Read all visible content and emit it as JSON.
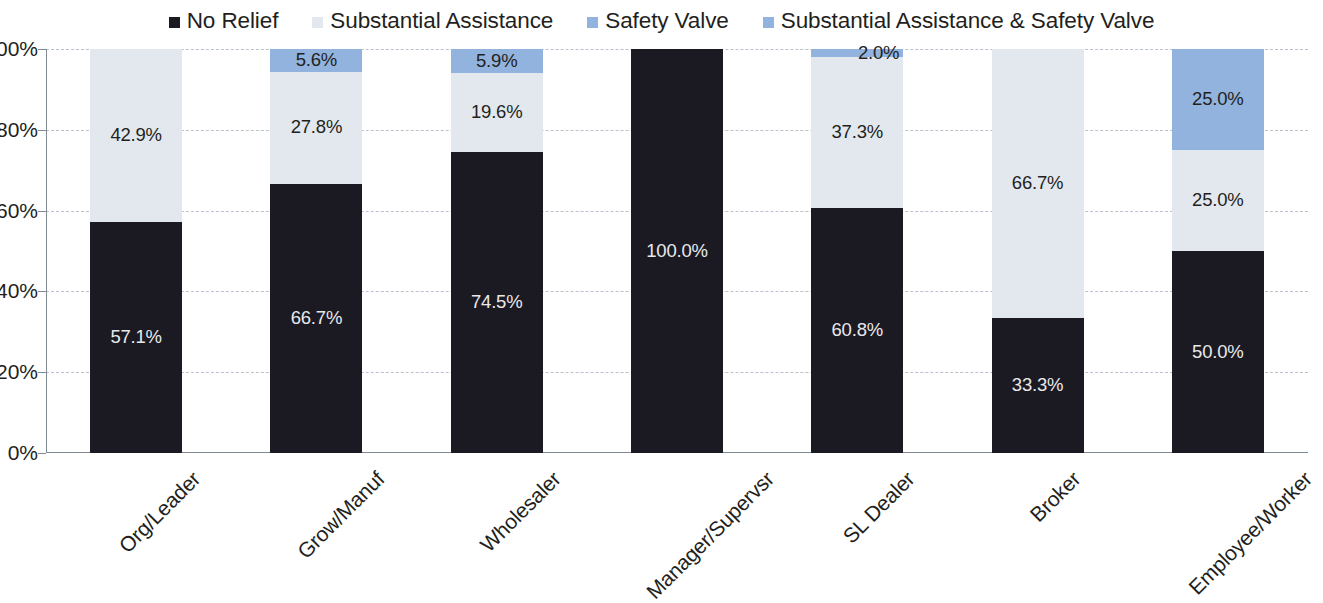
{
  "legend": {
    "items": [
      {
        "label": "No Relief",
        "color": "#1b1a22",
        "key": "no_relief"
      },
      {
        "label": "Substantial Assistance",
        "color": "#e2e8ee",
        "key": "substantial_assistance"
      },
      {
        "label": "Safety Valve",
        "color": "#91b3dd",
        "key": "safety_valve"
      },
      {
        "label": "Substantial Assistance & Safety Valve",
        "color": "#91b3dd",
        "key": "substantial_and_safety"
      }
    ]
  },
  "axis": {
    "y_ticks": [
      "0%",
      "20%",
      "40%",
      "60%",
      "80%",
      "100%"
    ],
    "y_tick_values": [
      0,
      20,
      40,
      60,
      80,
      100
    ]
  },
  "chart_data": {
    "type": "bar",
    "subtype": "100% stacked column",
    "title": "",
    "xlabel": "",
    "ylabel": "",
    "ylim": [
      0,
      100
    ],
    "grid": true,
    "legend_position": "top",
    "categories": [
      "Org/Leader",
      "Grow/Manuf",
      "Wholesaler",
      "Manager/Supervsr",
      "SL Dealer",
      "Broker",
      "Employee/Worker"
    ],
    "series": [
      {
        "name": "No Relief",
        "color": "#1b1a22",
        "values": [
          57.1,
          66.7,
          74.5,
          100.0,
          60.8,
          33.3,
          50.0
        ],
        "labels": [
          "57.1%",
          "66.7%",
          "74.5%",
          "100.0%",
          "60.8%",
          "33.3%",
          "50.0%"
        ]
      },
      {
        "name": "Substantial Assistance",
        "color": "#e2e8ee",
        "values": [
          42.9,
          27.8,
          19.6,
          0,
          37.3,
          66.7,
          25.0
        ],
        "labels": [
          "42.9%",
          "27.8%",
          "19.6%",
          "",
          "37.3%",
          "66.7%",
          "25.0%"
        ]
      },
      {
        "name": "Safety Valve",
        "color": "#91b3dd",
        "values": [
          0,
          5.6,
          5.9,
          0,
          2.0,
          0,
          25.0
        ],
        "labels": [
          "",
          "5.6%",
          "5.9%",
          "",
          "2.0%",
          "",
          "25.0%"
        ]
      }
    ],
    "columns": [
      {
        "category": "Org/Leader",
        "segments": [
          {
            "series": "No Relief",
            "value": 57.1,
            "label": "57.1%",
            "style": "s-none"
          },
          {
            "series": "Substantial Assistance",
            "value": 42.9,
            "label": "42.9%",
            "style": "s-subst"
          }
        ]
      },
      {
        "category": "Grow/Manuf",
        "segments": [
          {
            "series": "No Relief",
            "value": 66.7,
            "label": "66.7%",
            "style": "s-none"
          },
          {
            "series": "Substantial Assistance",
            "value": 27.8,
            "label": "27.8%",
            "style": "s-subst"
          },
          {
            "series": "Safety Valve",
            "value": 5.6,
            "label": "5.6%",
            "style": "s-safety"
          }
        ]
      },
      {
        "category": "Wholesaler",
        "segments": [
          {
            "series": "No Relief",
            "value": 74.5,
            "label": "74.5%",
            "style": "s-none"
          },
          {
            "series": "Substantial Assistance",
            "value": 19.6,
            "label": "19.6%",
            "style": "s-subst"
          },
          {
            "series": "Safety Valve",
            "value": 5.9,
            "label": "5.9%",
            "style": "s-safety"
          }
        ]
      },
      {
        "category": "Manager/Supervsr",
        "segments": [
          {
            "series": "No Relief",
            "value": 100.0,
            "label": "100.0%",
            "style": "s-none"
          }
        ]
      },
      {
        "category": "SL Dealer",
        "segments": [
          {
            "series": "No Relief",
            "value": 60.8,
            "label": "60.8%",
            "style": "s-none"
          },
          {
            "series": "Substantial Assistance",
            "value": 37.3,
            "label": "37.3%",
            "style": "s-subst"
          },
          {
            "series": "Safety Valve",
            "value": 2.0,
            "label": "2.0%",
            "style": "s-safety"
          }
        ]
      },
      {
        "category": "Broker",
        "segments": [
          {
            "series": "No Relief",
            "value": 33.3,
            "label": "33.3%",
            "style": "s-none"
          },
          {
            "series": "Substantial Assistance",
            "value": 66.7,
            "label": "66.7%",
            "style": "s-subst"
          }
        ]
      },
      {
        "category": "Employee/Worker",
        "segments": [
          {
            "series": "No Relief",
            "value": 50.0,
            "label": "50.0%",
            "style": "s-none"
          },
          {
            "series": "Substantial Assistance",
            "value": 25.0,
            "label": "25.0%",
            "style": "s-subst"
          },
          {
            "series": "Safety Valve",
            "value": 25.0,
            "label": "25.0%",
            "style": "s-safety"
          }
        ]
      }
    ]
  }
}
